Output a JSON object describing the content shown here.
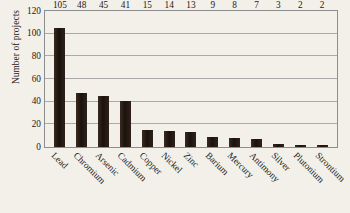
{
  "chart_data": {
    "type": "bar",
    "title": "",
    "xlabel": "",
    "ylabel": "Number of projects",
    "ylim": [
      0,
      120
    ],
    "yticks": [
      0,
      20,
      40,
      60,
      80,
      100,
      120
    ],
    "grid": true,
    "legend": "none",
    "orientation": "vertical",
    "bar_color": "#251a14",
    "background_color": "#f3f0ea",
    "grid_color": "#a9a9a9",
    "data_labels_shown": true,
    "xtick_rotation": 45,
    "categories": [
      "Lead",
      "Chromium",
      "Arsenic",
      "Cadmium",
      "Copper",
      "Nickel",
      "Zinc",
      "Barium",
      "Mercury",
      "Antimony",
      "Silver",
      "Plutonium",
      "Strontium"
    ],
    "values": [
      105,
      48,
      45,
      41,
      15,
      14,
      13,
      9,
      8,
      7,
      3,
      2,
      2
    ],
    "points": [
      {
        "category": "Lead",
        "value": 105
      },
      {
        "category": "Chromium",
        "value": 48
      },
      {
        "category": "Arsenic",
        "value": 45
      },
      {
        "category": "Cadmium",
        "value": 41
      },
      {
        "category": "Copper",
        "value": 15
      },
      {
        "category": "Nickel",
        "value": 14
      },
      {
        "category": "Zinc",
        "value": 13
      },
      {
        "category": "Barium",
        "value": 9
      },
      {
        "category": "Mercury",
        "value": 8
      },
      {
        "category": "Antimony",
        "value": 7
      },
      {
        "category": "Silver",
        "value": 3
      },
      {
        "category": "Plutonium",
        "value": 2
      },
      {
        "category": "Strontium",
        "value": 2
      }
    ]
  }
}
